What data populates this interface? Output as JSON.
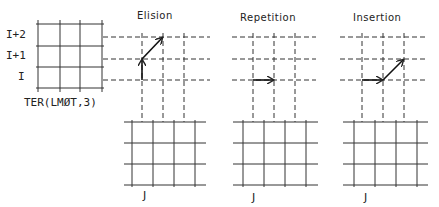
{
  "figure": {
    "source_grid": {
      "caption": "TER(LMØT,3)",
      "row_labels": [
        "I+2",
        "I+1",
        "I"
      ]
    },
    "panels": [
      {
        "title": "Elision",
        "column_label": "J",
        "path": "up one row from I to I+1, then diagonal to I+2 (skips a column step)"
      },
      {
        "title": "Repetition",
        "column_label": "J",
        "path": "horizontal step along row I"
      },
      {
        "title": "Insertion",
        "column_label": "J",
        "path": "horizontal step along row I, then diagonal to I+1"
      }
    ],
    "colors": {
      "ink": "#222222",
      "background": "#ffffff"
    }
  }
}
